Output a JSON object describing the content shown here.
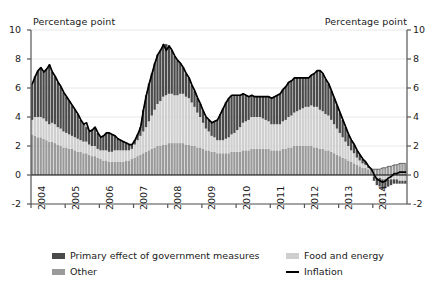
{
  "chart_data": {
    "type": "area",
    "subtype": "stacked-area-with-line",
    "title": "",
    "xlabel": "",
    "ylabel": "Percentage point",
    "ylabel_right": "Percentage point",
    "ylim": [
      -2,
      10
    ],
    "yticks": [
      10,
      8,
      6,
      4,
      2,
      0,
      -2
    ],
    "yticks_right": [
      10,
      8,
      6,
      4,
      2,
      0,
      -2
    ],
    "grid": true,
    "legend_position": "bottom",
    "xtick_labels": [
      "2004",
      "2005",
      "2006",
      "2007",
      "2008",
      "2009",
      "2010",
      "2011",
      "2012",
      "2013",
      "2014"
    ],
    "x_start": "2004-01",
    "x_end": "2014-12",
    "x_frequency": "monthly",
    "colors": {
      "primary_effect_of_government_measures": "#4a4a4a",
      "food_and_energy": "#cfcfcf",
      "other": "#9a9a9a",
      "inflation_line": "#000000",
      "grid": "#e8e8e8",
      "axis": "#555555"
    },
    "series": [
      {
        "name": "Other",
        "key": "other",
        "color": "#9a9a9a",
        "stack_order": 1,
        "values": [
          2.8,
          2.7,
          2.6,
          2.6,
          2.5,
          2.4,
          2.3,
          2.3,
          2.2,
          2.1,
          2.0,
          1.9,
          1.9,
          1.8,
          1.8,
          1.7,
          1.6,
          1.6,
          1.5,
          1.5,
          1.4,
          1.3,
          1.3,
          1.2,
          1.1,
          1.0,
          1.0,
          0.9,
          0.9,
          0.9,
          0.9,
          0.9,
          0.9,
          1.0,
          1.0,
          1.1,
          1.2,
          1.3,
          1.4,
          1.5,
          1.6,
          1.7,
          1.8,
          1.9,
          2.0,
          2.0,
          2.1,
          2.1,
          2.2,
          2.2,
          2.2,
          2.2,
          2.2,
          2.2,
          2.1,
          2.1,
          2.0,
          2.0,
          1.9,
          1.9,
          1.8,
          1.7,
          1.7,
          1.6,
          1.6,
          1.5,
          1.5,
          1.5,
          1.5,
          1.5,
          1.6,
          1.6,
          1.6,
          1.6,
          1.7,
          1.7,
          1.7,
          1.8,
          1.8,
          1.8,
          1.8,
          1.8,
          1.8,
          1.8,
          1.7,
          1.7,
          1.7,
          1.7,
          1.8,
          1.8,
          1.9,
          1.9,
          2.0,
          2.0,
          2.0,
          2.0,
          2.0,
          2.0,
          2.0,
          1.9,
          1.9,
          1.8,
          1.8,
          1.7,
          1.7,
          1.6,
          1.5,
          1.4,
          1.3,
          1.2,
          1.1,
          1.0,
          0.9,
          0.8,
          0.7,
          0.6,
          0.5,
          0.5,
          0.4,
          0.4,
          0.4,
          0.4,
          0.4,
          0.5,
          0.5,
          0.6,
          0.6,
          0.7,
          0.7,
          0.8,
          0.8,
          0.8
        ]
      },
      {
        "name": "Food and energy",
        "key": "food_and_energy",
        "color": "#cfcfcf",
        "stack_order": 2,
        "values": [
          1.0,
          1.3,
          1.4,
          1.4,
          1.4,
          1.3,
          1.2,
          1.3,
          1.3,
          1.2,
          1.2,
          1.1,
          1.0,
          1.0,
          0.9,
          0.9,
          0.9,
          0.8,
          0.8,
          0.8,
          0.7,
          0.7,
          0.7,
          0.6,
          0.6,
          0.7,
          0.7,
          0.7,
          0.7,
          0.8,
          0.8,
          0.8,
          0.8,
          0.7,
          0.7,
          0.7,
          0.9,
          1.1,
          1.3,
          1.5,
          1.7,
          2.0,
          2.3,
          2.6,
          2.9,
          3.1,
          3.3,
          3.4,
          3.4,
          3.4,
          3.3,
          3.3,
          3.4,
          3.4,
          3.3,
          3.2,
          3.0,
          2.7,
          2.4,
          2.1,
          1.8,
          1.5,
          1.3,
          1.1,
          1.0,
          0.9,
          0.9,
          0.9,
          1.0,
          1.1,
          1.2,
          1.3,
          1.5,
          1.7,
          1.9,
          2.0,
          2.1,
          2.2,
          2.2,
          2.2,
          2.2,
          2.1,
          2.0,
          1.9,
          1.8,
          1.8,
          1.8,
          1.8,
          1.9,
          2.0,
          2.1,
          2.2,
          2.3,
          2.4,
          2.5,
          2.6,
          2.7,
          2.7,
          2.8,
          2.8,
          2.8,
          2.7,
          2.6,
          2.5,
          2.4,
          2.2,
          2.0,
          1.8,
          1.6,
          1.4,
          1.2,
          1.0,
          0.8,
          0.7,
          0.5,
          0.4,
          0.3,
          0.2,
          0.1,
          0.0,
          -0.1,
          -0.2,
          -0.2,
          -0.3,
          -0.3,
          -0.3,
          -0.3,
          -0.3,
          -0.3,
          -0.4,
          -0.4,
          -0.4
        ]
      },
      {
        "name": "Primary effect of government measures",
        "key": "primary_effect_of_government_measures",
        "color": "#4a4a4a",
        "stack_order": 3,
        "values": [
          2.5,
          2.8,
          3.2,
          3.4,
          3.2,
          3.6,
          4.1,
          3.5,
          3.3,
          3.1,
          2.9,
          2.7,
          2.5,
          2.3,
          2.1,
          1.9,
          1.7,
          1.4,
          1.2,
          1.0,
          0.9,
          1.1,
          1.3,
          1.1,
          0.9,
          1.0,
          1.2,
          1.3,
          1.2,
          1.0,
          0.8,
          0.7,
          0.6,
          0.5,
          0.4,
          0.3,
          0.3,
          0.4,
          0.6,
          1.5,
          2.2,
          2.6,
          2.9,
          3.2,
          3.4,
          3.5,
          3.6,
          3.5,
          3.3,
          3.0,
          2.7,
          2.4,
          2.1,
          1.8,
          1.6,
          1.4,
          1.2,
          1.1,
          1.0,
          0.9,
          0.8,
          0.8,
          0.8,
          0.9,
          1.1,
          1.4,
          1.8,
          2.2,
          2.5,
          2.7,
          2.7,
          2.6,
          2.4,
          2.2,
          2.0,
          1.8,
          1.6,
          1.5,
          1.4,
          1.4,
          1.4,
          1.5,
          1.6,
          1.7,
          1.8,
          1.9,
          2.0,
          2.1,
          2.2,
          2.3,
          2.4,
          2.4,
          2.4,
          2.3,
          2.2,
          2.1,
          2.0,
          2.0,
          2.1,
          2.3,
          2.5,
          2.7,
          2.6,
          2.4,
          2.2,
          2.0,
          1.8,
          1.6,
          1.4,
          1.2,
          1.0,
          0.8,
          0.7,
          0.6,
          0.5,
          0.4,
          0.3,
          0.2,
          0.1,
          0.0,
          -0.3,
          -0.5,
          -0.6,
          -0.7,
          -0.6,
          -0.5,
          -0.4,
          -0.3,
          -0.3,
          -0.2,
          -0.2,
          -0.2
        ]
      }
    ],
    "line_series": {
      "name": "Inflation",
      "key": "inflation",
      "color": "#000000",
      "values": [
        6.3,
        6.8,
        7.2,
        7.4,
        7.1,
        7.3,
        7.6,
        7.1,
        6.8,
        6.4,
        6.1,
        5.7,
        5.4,
        5.1,
        4.8,
        4.5,
        4.2,
        3.8,
        3.5,
        3.6,
        3.0,
        3.1,
        3.3,
        2.9,
        2.6,
        2.7,
        2.9,
        2.9,
        2.8,
        2.7,
        2.5,
        2.4,
        2.3,
        2.2,
        2.1,
        2.1,
        2.4,
        2.8,
        3.3,
        4.5,
        5.5,
        6.3,
        7.0,
        7.7,
        8.3,
        8.6,
        9.0,
        8.6,
        8.9,
        8.6,
        8.2,
        7.9,
        7.7,
        7.4,
        7.0,
        6.7,
        6.2,
        5.8,
        5.3,
        4.9,
        4.4,
        4.0,
        3.8,
        3.6,
        3.7,
        3.8,
        4.2,
        4.6,
        5.0,
        5.3,
        5.5,
        5.5,
        5.5,
        5.5,
        5.6,
        5.5,
        5.4,
        5.5,
        5.4,
        5.4,
        5.4,
        5.4,
        5.4,
        5.4,
        5.3,
        5.4,
        5.5,
        5.6,
        5.9,
        6.1,
        6.4,
        6.5,
        6.7,
        6.7,
        6.7,
        6.7,
        6.7,
        6.7,
        6.9,
        7.0,
        7.2,
        7.2,
        7.0,
        6.6,
        6.3,
        5.8,
        5.3,
        4.8,
        4.3,
        3.8,
        3.3,
        2.8,
        2.4,
        2.1,
        1.7,
        1.4,
        1.1,
        0.9,
        0.6,
        0.4,
        0.0,
        -0.3,
        -0.4,
        -0.5,
        -0.4,
        -0.2,
        -0.1,
        0.1,
        0.1,
        0.2,
        0.2,
        0.2
      ]
    }
  },
  "labels": {
    "unit_left": "Percentage point",
    "unit_right": "Percentage point"
  },
  "legend": {
    "items": [
      {
        "label": "Primary effect of government measures",
        "type": "swatch",
        "color": "#4a4a4a"
      },
      {
        "label": "Other",
        "type": "swatch",
        "color": "#9a9a9a"
      },
      {
        "label": "Food and energy",
        "type": "swatch",
        "color": "#cfcfcf"
      },
      {
        "label": "Inflation",
        "type": "line",
        "color": "#000000"
      }
    ]
  }
}
